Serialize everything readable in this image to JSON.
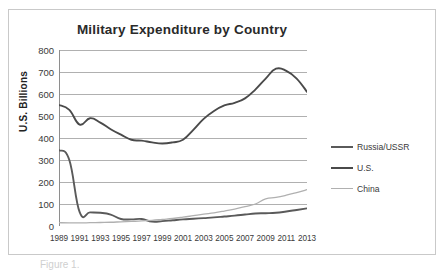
{
  "figure": {
    "caption": "Figure 1."
  },
  "chart_data": {
    "type": "line",
    "title": "Military Expenditure by Country",
    "xlabel": "",
    "ylabel": "U.S. Billions",
    "ylim": [
      0,
      800
    ],
    "ytick_step": 100,
    "yticks": [
      0,
      100,
      200,
      300,
      400,
      500,
      600,
      700,
      800
    ],
    "xlim": [
      1989,
      2013
    ],
    "xticks": [
      1989,
      1991,
      1993,
      1995,
      1997,
      1999,
      2001,
      2003,
      2005,
      2007,
      2009,
      2011,
      2013
    ],
    "x": [
      1989,
      1990,
      1991,
      1992,
      1993,
      1994,
      1995,
      1996,
      1997,
      1998,
      1999,
      2000,
      2001,
      2002,
      2003,
      2004,
      2005,
      2006,
      2007,
      2008,
      2009,
      2010,
      2011,
      2012,
      2013
    ],
    "grid": true,
    "legend_position": "right",
    "series": [
      {
        "name": "Russia/USSR",
        "color": "#5a5a5a",
        "values": [
          345,
          300,
          63,
          62,
          60,
          52,
          32,
          30,
          32,
          20,
          22,
          26,
          30,
          33,
          36,
          39,
          43,
          47,
          52,
          57,
          58,
          60,
          66,
          73,
          80
        ]
      },
      {
        "name": "U.S.",
        "color": "#4a4a4a",
        "values": [
          550,
          528,
          461,
          490,
          470,
          440,
          415,
          392,
          388,
          380,
          375,
          380,
          392,
          437,
          487,
          523,
          548,
          560,
          580,
          620,
          670,
          715,
          705,
          670,
          610
        ]
      },
      {
        "name": "China",
        "color": "#b0b0b0",
        "values": [
          15,
          14,
          14,
          15,
          16,
          17,
          19,
          21,
          23,
          26,
          30,
          34,
          40,
          47,
          54,
          60,
          68,
          77,
          88,
          100,
          123,
          130,
          140,
          152,
          165
        ]
      }
    ]
  },
  "legend": {
    "items": [
      {
        "label": "Russia/USSR"
      },
      {
        "label": "U.S."
      },
      {
        "label": "China"
      }
    ]
  }
}
